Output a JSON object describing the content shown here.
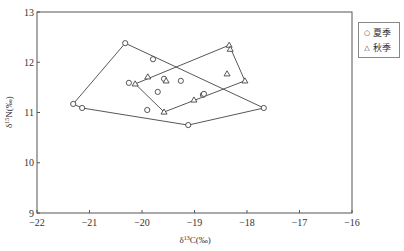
{
  "chart_data": {
    "type": "scatter",
    "title": "",
    "xlabel": "δ13C(‰)",
    "ylabel": "δ15N(‰)",
    "xlim": [
      -22,
      -16
    ],
    "ylim": [
      9,
      13
    ],
    "x_ticks": [
      -22,
      -21,
      -20,
      -19,
      -18,
      -17,
      -16
    ],
    "y_ticks": [
      9,
      10,
      11,
      12,
      13
    ],
    "grid": false,
    "legend_position": "right-outside-top",
    "series": [
      {
        "name": "夏季",
        "marker": "circle",
        "points": [
          [
            -21.31,
            11.17
          ],
          [
            -21.14,
            11.09
          ],
          [
            -20.32,
            12.38
          ],
          [
            -19.79,
            12.06
          ],
          [
            -20.25,
            11.59
          ],
          [
            -19.7,
            11.41
          ],
          [
            -19.9,
            11.05
          ],
          [
            -19.58,
            11.67
          ],
          [
            -19.26,
            11.63
          ],
          [
            -19.12,
            10.75
          ],
          [
            -18.84,
            11.35
          ],
          [
            -18.82,
            11.37
          ],
          [
            -17.68,
            11.09
          ]
        ],
        "hull": [
          [
            -21.31,
            11.17
          ],
          [
            -20.32,
            12.38
          ],
          [
            -17.68,
            11.09
          ],
          [
            -19.12,
            10.75
          ],
          [
            -21.14,
            11.09
          ]
        ]
      },
      {
        "name": "秋季",
        "marker": "triangle",
        "points": [
          [
            -20.13,
            11.57
          ],
          [
            -19.89,
            11.71
          ],
          [
            -19.54,
            11.63
          ],
          [
            -19.58,
            11.01
          ],
          [
            -19.01,
            11.25
          ],
          [
            -18.38,
            11.77
          ],
          [
            -18.34,
            12.34
          ],
          [
            -18.32,
            12.26
          ],
          [
            -18.04,
            11.63
          ]
        ],
        "hull": [
          [
            -20.13,
            11.57
          ],
          [
            -18.34,
            12.34
          ],
          [
            -18.04,
            11.63
          ],
          [
            -19.58,
            11.01
          ]
        ]
      }
    ]
  },
  "legend": {
    "items": [
      {
        "label": "夏季",
        "symbol": "○"
      },
      {
        "label": "秋季",
        "symbol": "△"
      }
    ]
  },
  "axes": {
    "xlabel": "δ13C(‰)",
    "ylabel": "δ15N(‰)"
  }
}
